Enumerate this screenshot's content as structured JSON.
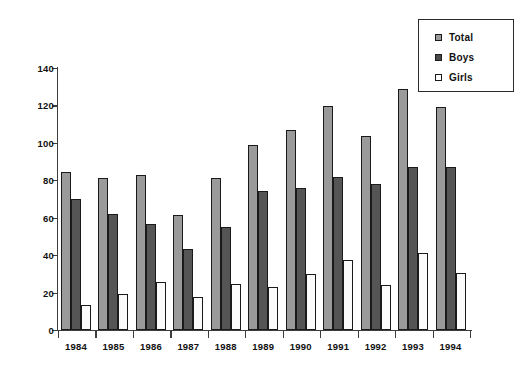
{
  "chart_data": {
    "type": "bar",
    "title": "",
    "subtitle": "",
    "xlabel": "",
    "ylabel": "",
    "categories": [
      "1984",
      "1985",
      "1986",
      "1987",
      "1988",
      "1989",
      "1990",
      "1991",
      "1992",
      "1993",
      "1994"
    ],
    "series": [
      {
        "name": "Total",
        "color": "#9a9a9a",
        "values": [
          84.5,
          81,
          83,
          61.5,
          81,
          99,
          107,
          119.5,
          103.5,
          129,
          119
        ]
      },
      {
        "name": "Boys",
        "color": "#555555",
        "values": [
          70,
          62,
          56.5,
          43.5,
          55,
          74.5,
          76,
          82,
          78,
          87,
          87
        ]
      },
      {
        "name": "Girls",
        "color": "#ffffff",
        "values": [
          13.5,
          19,
          25.5,
          17.5,
          24.5,
          23,
          30,
          37.5,
          24,
          41,
          30.5
        ]
      }
    ],
    "ylim": [
      0,
      140
    ],
    "ytick_labels": [
      "0",
      "20",
      "40",
      "60",
      "80",
      "100",
      "120",
      "140"
    ],
    "ytick_values": [
      0,
      20,
      40,
      60,
      80,
      100,
      120,
      140
    ],
    "grid": false,
    "legend_position": "top-right",
    "legend_entries": [
      "Total",
      "Boys",
      "Girls"
    ]
  },
  "legend": {
    "items": [
      {
        "label": "Total",
        "swatch": "total-swatch-icon"
      },
      {
        "label": "Boys",
        "swatch": "boys-swatch-icon"
      },
      {
        "label": "Girls",
        "swatch": "girls-swatch-icon"
      }
    ]
  }
}
